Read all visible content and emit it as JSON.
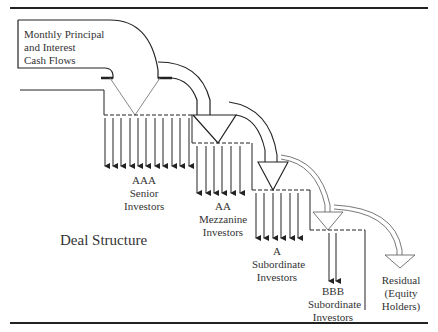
{
  "diagram": {
    "title": "Deal Structure",
    "source": {
      "line1": "Monthly Principal",
      "line2": "and Interest",
      "line3": "Cash Flows"
    },
    "tranches": [
      {
        "rating": "AAA",
        "line2": "Senior",
        "line3": "Investors",
        "arrow_count": 11
      },
      {
        "rating": "AA",
        "line2": "Mezzanine",
        "line3": "Investors",
        "arrow_count": 6
      },
      {
        "rating": "A",
        "line2": "Subordinate",
        "line3": "Investors",
        "arrow_count": 6
      },
      {
        "rating": "BBB",
        "line2": "Subordinate",
        "line3": "Investors",
        "arrow_count": 2
      }
    ],
    "residual": {
      "line1": "Residual",
      "line2": "(Equity",
      "line3": "Holders)"
    }
  }
}
